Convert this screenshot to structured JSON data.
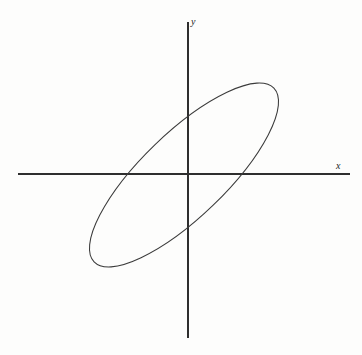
{
  "figure": {
    "width": 362,
    "height": 355,
    "background_color": "#fdfdfc",
    "stroke_color": "#3b3b3b",
    "axis_color": "#2e2e2e"
  },
  "labels": {
    "x_axis": "x",
    "y_axis": "y"
  },
  "chart_data": {
    "type": "line",
    "title": "",
    "subtitle": "",
    "xlabel": "x",
    "ylabel": "y",
    "grid": false,
    "legend": false,
    "axes": {
      "origin_px": [
        188,
        174
      ],
      "x_axis_extent_px": [
        18,
        350
      ],
      "y_axis_extent_px": [
        22,
        338
      ],
      "x_axis_y_px": 174,
      "y_axis_x_px": 188,
      "arrowheads": false,
      "ticks": false,
      "tick_labels": []
    },
    "annotations": [
      {
        "text": "x",
        "px": [
          336,
          166
        ],
        "style": "italic-serif"
      },
      {
        "text": "y",
        "px": [
          193,
          22
        ],
        "style": "italic-serif"
      }
    ],
    "shapes": [
      {
        "name": "rotated-ellipse",
        "type": "ellipse",
        "center_px": [
          184,
          175
        ],
        "semi_major_px": 125,
        "semi_minor_px": 42,
        "rotation_deg": -44,
        "closed": true,
        "fill": "none",
        "stroke": "#3b3b3b",
        "stroke_width": 1.05,
        "extremes_px": {
          "leftmost": [
            92,
            248
          ],
          "rightmost": [
            276,
            102
          ],
          "topmost": [
            257,
            88
          ],
          "bottommost": [
            111,
            262
          ]
        },
        "x_axis_intercepts_px": [
          137,
          213
        ],
        "y_axis_intercepts_px": [
          134,
          216
        ]
      }
    ]
  }
}
